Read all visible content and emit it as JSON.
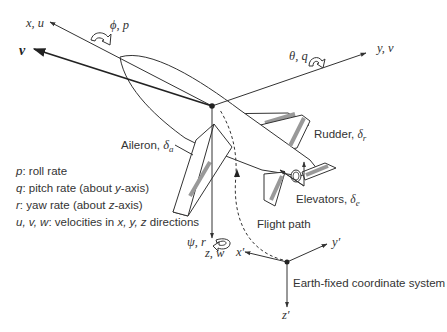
{
  "figure": {
    "body_axes": {
      "x": {
        "label": "x, u",
        "rotation_label": "ϕ, p"
      },
      "y": {
        "label": "y, v",
        "rotation_label": "θ, q"
      },
      "z": {
        "label": "z, w",
        "rotation_label": "ψ, r"
      },
      "velocity": {
        "label": "v"
      }
    },
    "control_surfaces": {
      "aileron": {
        "label": "Aileron, ",
        "symbol": "δ",
        "sub": "a"
      },
      "rudder": {
        "label": "Rudder, ",
        "symbol": "δ",
        "sub": "r"
      },
      "elevators": {
        "label": "Elevators, ",
        "symbol": "δ",
        "sub": "e"
      }
    },
    "flight_path": {
      "label": "Flight path"
    },
    "earth_axes": {
      "title": "Earth-fixed coordinate system",
      "x": "x′",
      "y": "y′",
      "z": "z′"
    },
    "legend": [
      {
        "symbol": "p",
        "text": ": roll rate"
      },
      {
        "symbol": "q",
        "text": ": pitch rate (about ",
        "axis": "y",
        "tail": "-axis)"
      },
      {
        "symbol": "r",
        "text": ": yaw rate (about ",
        "axis": "z",
        "tail": "-axis)"
      },
      {
        "symbol": "u, v, w",
        "text": ": velocities in ",
        "axes": "x, y, z",
        "tail": " directions"
      }
    ],
    "colors": {
      "line": "#333333",
      "control_surface": "#999999",
      "background": "#ffffff"
    }
  }
}
